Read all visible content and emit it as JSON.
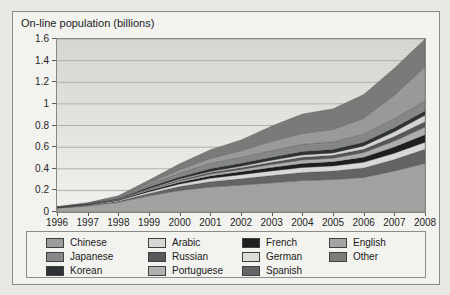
{
  "figure": {
    "title": "On-line population (billions)"
  },
  "axes": {
    "y_tick_labels_top_to_bottom": [
      "1.6",
      "1.4",
      "1.2",
      "1",
      "0.8",
      "0.6",
      "0.4",
      "0.2",
      "0"
    ],
    "x_tick_labels": [
      "1996",
      "1997",
      "1998",
      "1999",
      "2000",
      "2001",
      "2002",
      "2003",
      "2004",
      "2005",
      "2006",
      "2007",
      "2008"
    ]
  },
  "colors": {
    "page_bg": "#e7e7e3",
    "figure_bg": "#f2f2ee",
    "figure_border": "#8b8c88",
    "plot_border": "#858783",
    "gridline": "#b2b3af",
    "text": "#1f1f1f"
  },
  "chart_data": {
    "type": "area",
    "stacked": true,
    "title": "On-line population (billions)",
    "ylabel": "On-line population (billions)",
    "xlabel": "",
    "x": [
      1996,
      1997,
      1998,
      1999,
      2000,
      2001,
      2002,
      2003,
      2004,
      2005,
      2006,
      2007,
      2008
    ],
    "ylim": [
      0,
      1.6
    ],
    "y_tick_step": 0.2,
    "grid": "horizontal",
    "legend_position": "bottom-box",
    "series_bottom_to_top": [
      {
        "name": "English",
        "color": "#a3a5a3",
        "values": [
          0.036,
          0.056,
          0.09,
          0.15,
          0.2,
          0.23,
          0.25,
          0.27,
          0.29,
          0.3,
          0.32,
          0.38,
          0.45
        ]
      },
      {
        "name": "Spanish",
        "color": "#636567",
        "values": [
          0.002,
          0.004,
          0.009,
          0.022,
          0.035,
          0.05,
          0.058,
          0.068,
          0.075,
          0.078,
          0.088,
          0.105,
          0.13
        ]
      },
      {
        "name": "German",
        "color": "#dcddda",
        "values": [
          0.002,
          0.004,
          0.008,
          0.016,
          0.024,
          0.032,
          0.037,
          0.042,
          0.047,
          0.048,
          0.052,
          0.058,
          0.065
        ]
      },
      {
        "name": "French",
        "color": "#1d1f21",
        "values": [
          0.001,
          0.002,
          0.005,
          0.011,
          0.016,
          0.022,
          0.027,
          0.032,
          0.037,
          0.038,
          0.047,
          0.057,
          0.07
        ]
      },
      {
        "name": "Portuguese",
        "color": "#afb1b0",
        "values": [
          0.001,
          0.002,
          0.003,
          0.009,
          0.013,
          0.018,
          0.022,
          0.028,
          0.032,
          0.034,
          0.042,
          0.056,
          0.07
        ]
      },
      {
        "name": "Russian",
        "color": "#56585a",
        "values": [
          0.001,
          0.001,
          0.002,
          0.006,
          0.009,
          0.013,
          0.016,
          0.021,
          0.026,
          0.026,
          0.031,
          0.041,
          0.05
        ]
      },
      {
        "name": "Arabic",
        "color": "#d7d8d5",
        "values": [
          0.0005,
          0.001,
          0.002,
          0.004,
          0.007,
          0.009,
          0.013,
          0.017,
          0.021,
          0.023,
          0.031,
          0.046,
          0.06
        ]
      },
      {
        "name": "Korean",
        "color": "#303335",
        "values": [
          0.001,
          0.003,
          0.006,
          0.013,
          0.02,
          0.026,
          0.027,
          0.029,
          0.031,
          0.032,
          0.034,
          0.036,
          0.038
        ]
      },
      {
        "name": "Japanese",
        "color": "#868889",
        "values": [
          0.002,
          0.005,
          0.01,
          0.022,
          0.037,
          0.05,
          0.057,
          0.062,
          0.067,
          0.07,
          0.077,
          0.086,
          0.094
        ]
      },
      {
        "name": "Chinese",
        "color": "#9b9d9b",
        "values": [
          0.0005,
          0.002,
          0.004,
          0.012,
          0.03,
          0.045,
          0.06,
          0.085,
          0.1,
          0.115,
          0.145,
          0.215,
          0.315
        ]
      },
      {
        "name": "Other",
        "color": "#7b7d7b",
        "values": [
          0.004,
          0.007,
          0.012,
          0.03,
          0.055,
          0.08,
          0.1,
          0.14,
          0.18,
          0.19,
          0.22,
          0.25,
          0.3
        ]
      }
    ],
    "legend_columns": [
      [
        "Chinese",
        "Japanese",
        "Korean"
      ],
      [
        "Arabic",
        "Russian",
        "Portuguese"
      ],
      [
        "French",
        "German",
        "Spanish"
      ],
      [
        "English",
        "Other"
      ]
    ]
  }
}
